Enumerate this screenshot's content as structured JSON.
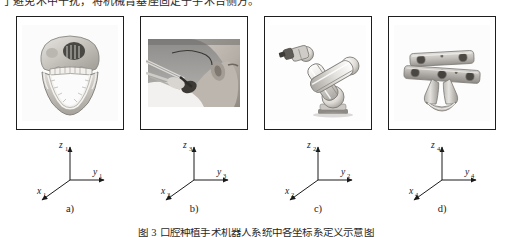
{
  "top_text": {
    "content": "了避免术中干扰，将机械臂基座固定于手术台侧方。"
  },
  "caption": {
    "content": "图 3   口腔种植手术机器人系统中各坐标系定义示意图"
  },
  "panels": [
    {
      "id": "panel-a",
      "sublabel": "a)",
      "artwork": "mandible-skull-model",
      "frame": {
        "z": "z",
        "z_sub": "1",
        "y": "y",
        "y_sub": "1",
        "x": "x",
        "x_sub": "1"
      }
    },
    {
      "id": "panel-b",
      "sublabel": "b)",
      "artwork": "clinical-surgery-photo",
      "frame": {
        "z": "z",
        "z_sub": "3",
        "y": "y",
        "y_sub": "3",
        "x": "x",
        "x_sub": "3"
      }
    },
    {
      "id": "panel-c",
      "sublabel": "c)",
      "artwork": "robot-arm",
      "frame": {
        "z": "z",
        "z_sub": "2",
        "y": "y",
        "y_sub": "2",
        "x": "x",
        "x_sub": "2"
      }
    },
    {
      "id": "panel-d",
      "sublabel": "d)",
      "artwork": "surgical-splint-fixture",
      "frame": {
        "z": "z",
        "z_sub": "4",
        "y": "y",
        "y_sub": "4",
        "x": "x",
        "x_sub": "4"
      }
    }
  ],
  "colors": {
    "border": "#1e1e1e",
    "axis": "#1a1a1a",
    "text": "#1a1a1a",
    "page_background": "#ffffff"
  }
}
